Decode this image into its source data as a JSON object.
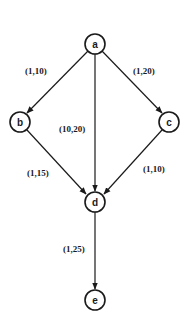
{
  "diagram": {
    "type": "directed-graph",
    "nodes": [
      {
        "id": "a",
        "label": "a",
        "x": 95,
        "y": 44
      },
      {
        "id": "b",
        "label": "b",
        "x": 20,
        "y": 122
      },
      {
        "id": "c",
        "label": "c",
        "x": 169,
        "y": 122
      },
      {
        "id": "d",
        "label": "d",
        "x": 95,
        "y": 202
      },
      {
        "id": "e",
        "label": "e",
        "x": 95,
        "y": 300
      }
    ],
    "edges": [
      {
        "from": "a",
        "to": "b",
        "label": "(1,10)"
      },
      {
        "from": "a",
        "to": "c",
        "label": "(1,20)"
      },
      {
        "from": "a",
        "to": "d",
        "label": "(10,20)"
      },
      {
        "from": "b",
        "to": "d",
        "label": "(1,15)"
      },
      {
        "from": "c",
        "to": "d",
        "label": "(1,10)"
      },
      {
        "from": "d",
        "to": "e",
        "label": "(1,25)"
      }
    ]
  },
  "labels": {
    "node_a": "a",
    "node_b": "b",
    "node_c": "c",
    "node_d": "d",
    "node_e": "e",
    "edge_ab": "(1,10)",
    "edge_ac": "(1,20)",
    "edge_ad": "(10,20)",
    "edge_bd": "(1,15)",
    "edge_cd": "(1,10)",
    "edge_de": "(1,25)"
  }
}
